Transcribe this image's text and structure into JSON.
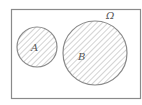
{
  "diagram": {
    "type": "venn",
    "universe_label": "Ω",
    "sets": [
      {
        "label": "A",
        "shaded": true
      },
      {
        "label": "B",
        "shaded": true
      }
    ],
    "relationship": "disjoint",
    "colors": {
      "stroke": "#8a8a8a",
      "hatch": "#a0a0a0",
      "background": "#ffffff"
    }
  }
}
